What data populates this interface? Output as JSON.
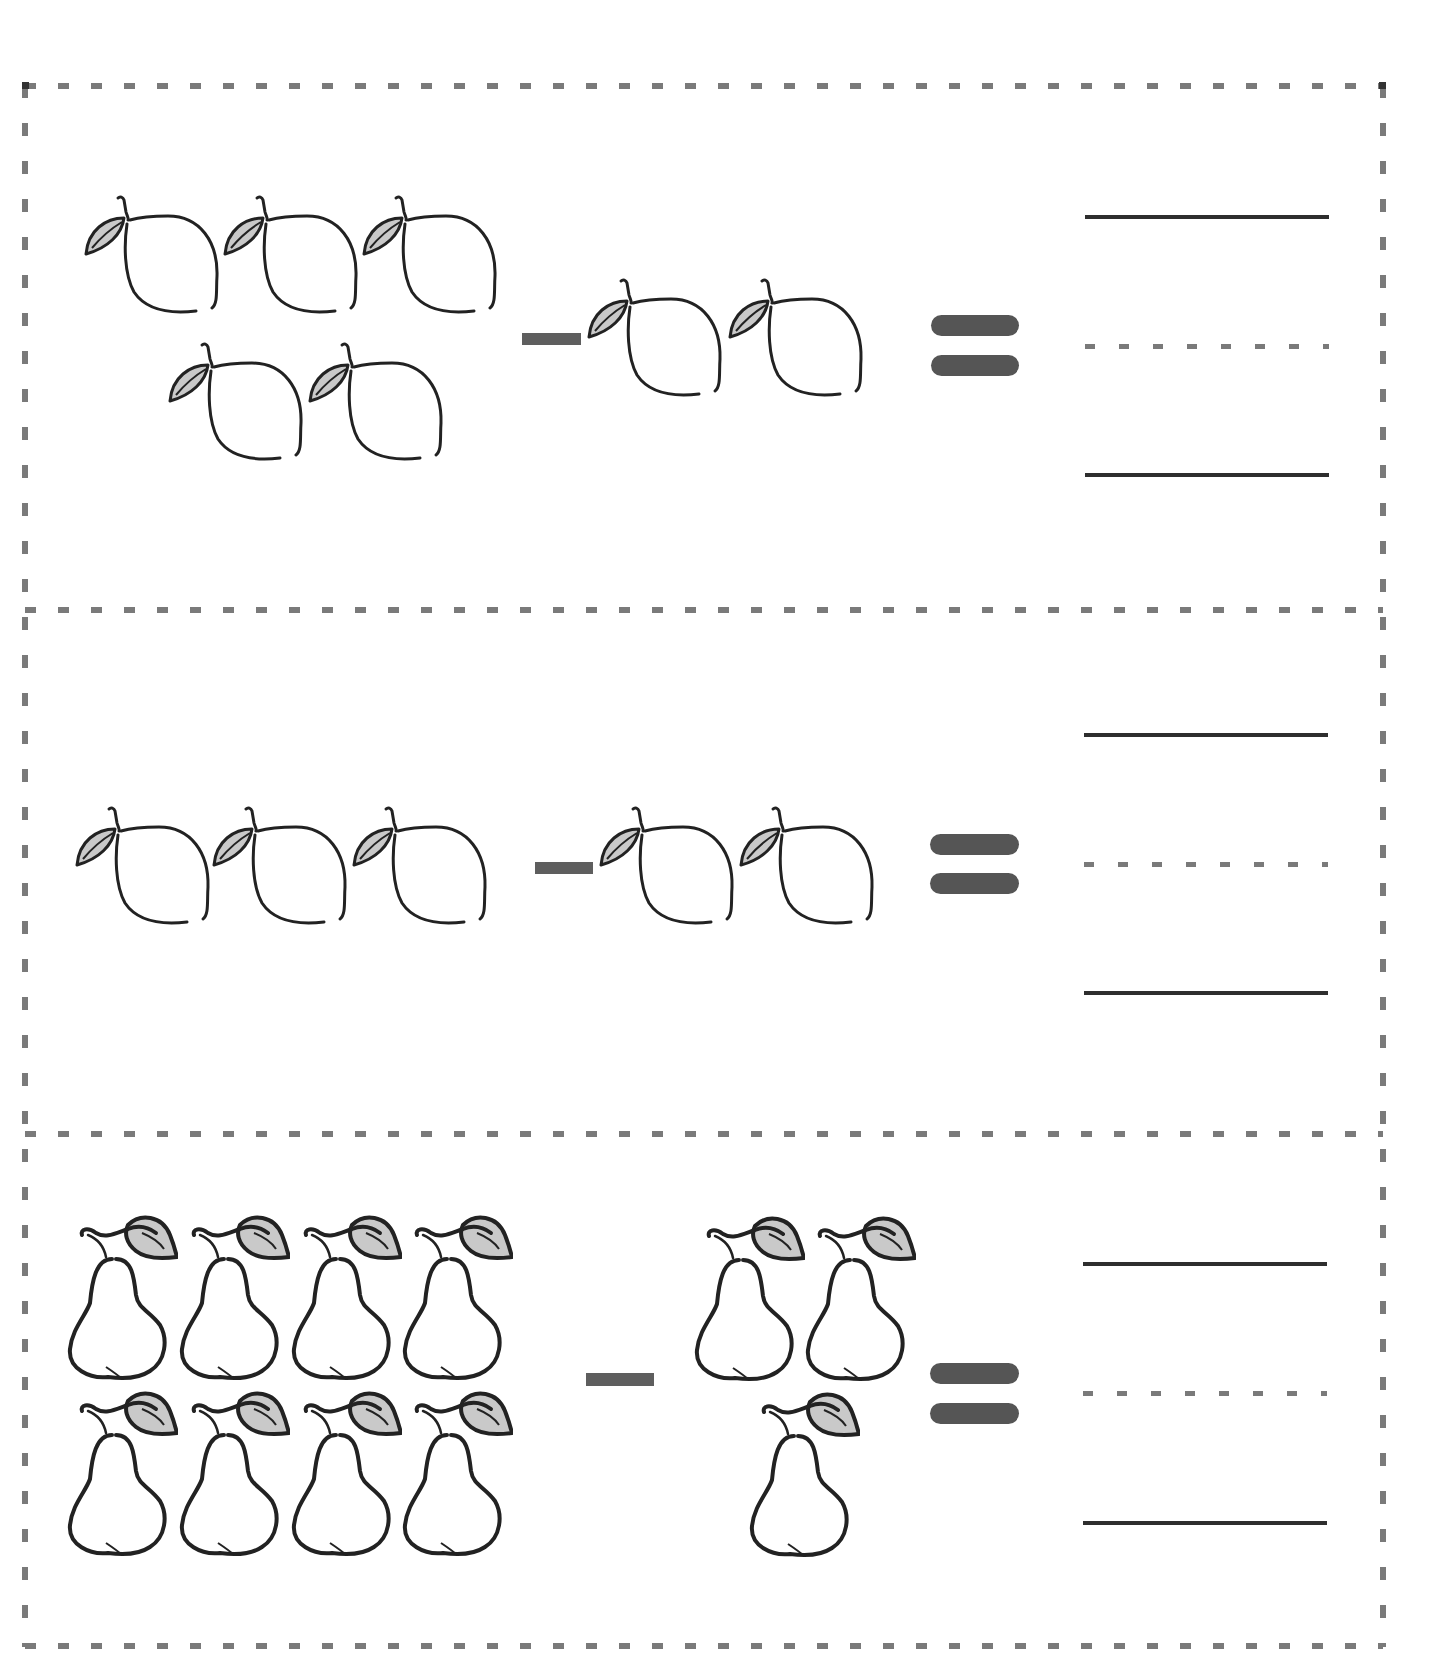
{
  "worksheet": {
    "type": "subtraction-with-pictures",
    "colors": {
      "outline": "#222222",
      "leaf_fill": "#c9c9c9",
      "dash": "#7a7a7a",
      "operator": "#555555",
      "answer_line": "#2e2e2e"
    },
    "problems": [
      {
        "id": 1,
        "fruit": "lemon",
        "minuend_count": 5,
        "subtrahend_count": 2,
        "operator": "minus",
        "equals": "equals",
        "answer_lines": [
          "solid",
          "dotted",
          "solid"
        ]
      },
      {
        "id": 2,
        "fruit": "lemon",
        "minuend_count": 3,
        "subtrahend_count": 2,
        "operator": "minus",
        "equals": "equals",
        "answer_lines": [
          "solid",
          "dotted",
          "solid"
        ]
      },
      {
        "id": 3,
        "fruit": "pear",
        "minuend_count": 8,
        "subtrahend_count": 3,
        "operator": "minus",
        "equals": "equals",
        "answer_lines": [
          "solid",
          "dotted",
          "solid"
        ]
      }
    ]
  }
}
